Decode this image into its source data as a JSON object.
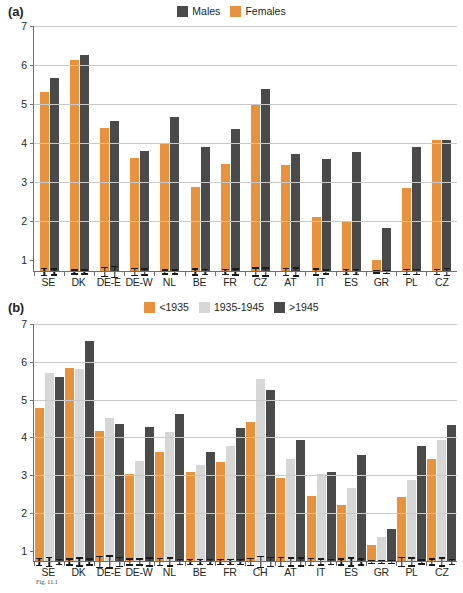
{
  "figure": {
    "caption_prefix": "Fig. 11.1",
    "caption": "Fig. 11.1"
  },
  "panel_a": {
    "tag": "(a)",
    "legend": [
      {
        "label": "Males",
        "color": "#4a4a4a",
        "key": "males"
      },
      {
        "label": "Females",
        "color": "#e8913f",
        "key": "females"
      }
    ],
    "yticks": [
      "1",
      "2",
      "3",
      "4",
      "5",
      "6",
      "7"
    ]
  },
  "panel_b": {
    "tag": "(b)",
    "legend": [
      {
        "label": "<1935",
        "color": "#e8913f",
        "key": "pre1935"
      },
      {
        "label": "1935-1945",
        "color": "#d7d7d7",
        "key": "mid"
      },
      {
        "label": ">1945",
        "color": "#4a4a4a",
        "key": "post1945"
      }
    ],
    "yticks": [
      "1",
      "2",
      "3",
      "4",
      "5",
      "6",
      "7"
    ]
  },
  "chart_data": [
    {
      "id": "panel-a",
      "type": "bar",
      "title": "(a)",
      "xlabel": "",
      "ylabel": "",
      "ylim": [
        1,
        7
      ],
      "grid": true,
      "legend_position": "top-center",
      "categories": [
        "SE",
        "DK",
        "DE-E",
        "DE-W",
        "NL",
        "BE",
        "FR",
        "CZ",
        "AT",
        "IT",
        "ES",
        "GR",
        "PL",
        "CZ"
      ],
      "series": [
        {
          "name": "Females",
          "color": "#e8913f",
          "values": [
            5.3,
            6.12,
            4.38,
            3.62,
            4.0,
            2.87,
            3.47,
            5.0,
            3.44,
            2.1,
            1.98,
            1.02,
            2.86,
            4.09
          ],
          "errors": [
            0.1,
            0.07,
            0.14,
            0.1,
            0.07,
            0.09,
            0.08,
            0.12,
            0.11,
            0.09,
            0.08,
            0.04,
            0.08,
            0.08
          ]
        },
        {
          "name": "Males",
          "color": "#4a4a4a",
          "values": [
            5.68,
            6.27,
            4.56,
            3.79,
            4.67,
            3.89,
            4.35,
            5.39,
            3.72,
            3.59,
            3.78,
            1.84,
            3.9,
            4.07
          ],
          "errors": [
            0.09,
            0.07,
            0.16,
            0.09,
            0.07,
            0.08,
            0.09,
            0.12,
            0.12,
            0.07,
            0.08,
            0.05,
            0.08,
            0.1
          ]
        }
      ]
    },
    {
      "id": "panel-b",
      "type": "bar",
      "title": "(b)",
      "xlabel": "",
      "ylabel": "",
      "ylim": [
        1,
        7
      ],
      "grid": true,
      "legend_position": "top-center",
      "categories": [
        "SE",
        "DK",
        "DE-E",
        "DE-W",
        "NL",
        "BE",
        "FR",
        "CH",
        "AT",
        "IT",
        "ES",
        "GR",
        "PL",
        "CZ"
      ],
      "series": [
        {
          "name": "<1935",
          "color": "#e8913f",
          "values": [
            4.78,
            5.84,
            4.16,
            3.04,
            3.6,
            3.08,
            3.34,
            4.4,
            2.92,
            2.46,
            2.2,
            1.14,
            2.42,
            3.42
          ],
          "errors": [
            0.11,
            0.1,
            0.16,
            0.1,
            0.11,
            0.08,
            0.08,
            0.11,
            0.13,
            0.11,
            0.1,
            0.06,
            0.14,
            0.1
          ]
        },
        {
          "name": "1935-1945",
          "color": "#d7d7d7",
          "values": [
            5.7,
            5.8,
            4.5,
            3.38,
            4.13,
            3.28,
            3.76,
            5.55,
            3.44,
            3.04,
            2.66,
            1.35,
            2.88,
            3.93
          ],
          "errors": [
            0.14,
            0.12,
            0.18,
            0.1,
            0.12,
            0.08,
            0.08,
            0.16,
            0.12,
            0.1,
            0.12,
            0.06,
            0.12,
            0.12
          ]
        },
        {
          "name": ">1945",
          "color": "#4a4a4a",
          "values": [
            5.6,
            6.56,
            4.35,
            4.28,
            4.63,
            3.62,
            4.24,
            5.25,
            3.92,
            3.08,
            3.52,
            1.57,
            3.77,
            4.32
          ],
          "errors": [
            0.09,
            0.1,
            0.13,
            0.12,
            0.08,
            0.08,
            0.09,
            0.13,
            0.12,
            0.08,
            0.1,
            0.06,
            0.07,
            0.08
          ]
        }
      ]
    }
  ]
}
